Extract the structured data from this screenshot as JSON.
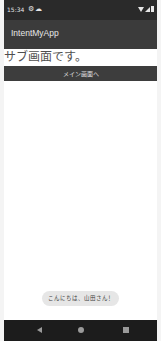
{
  "status_bar": {
    "time": "15:34",
    "icons_left": [
      "gear-icon",
      "cloud-icon"
    ],
    "icons_right": [
      "wifi-icon",
      "signal-icon",
      "battery-icon"
    ]
  },
  "app_bar": {
    "title": "IntentMyApp"
  },
  "main": {
    "text": "サブ画面です。",
    "button_label": "メイン画面へ"
  },
  "toast": {
    "message": "こんにちは、山田さん！"
  },
  "nav_bar": {
    "buttons": [
      "back",
      "home",
      "recents"
    ]
  },
  "colors": {
    "status_bar": "#2a2a2a",
    "app_bar": "#3b3b3b",
    "button": "#3d3d3d",
    "toast": "#e6e6e6",
    "nav_bar": "#1c1c1c"
  }
}
